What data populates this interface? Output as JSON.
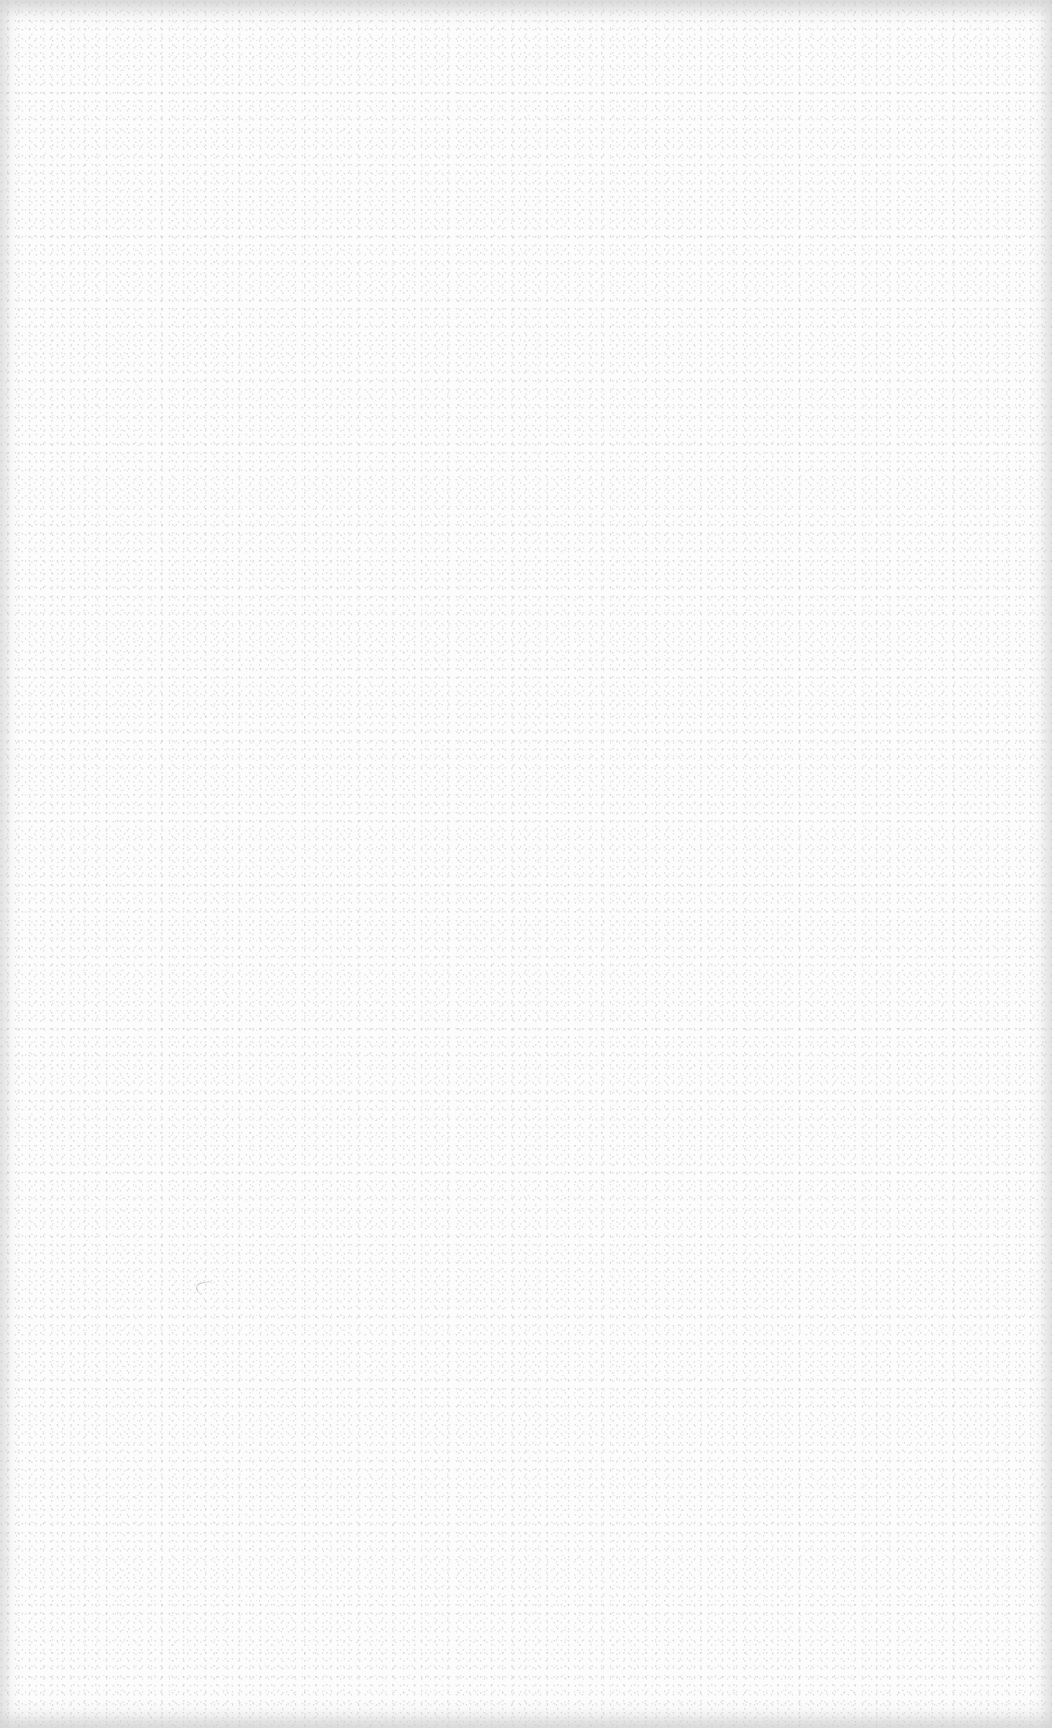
{
  "page": {
    "type": "blank-scanned-sheet",
    "text_content": [],
    "colors": {
      "paper": "#fcfcfc",
      "speckle": "#aaaaaa",
      "edge_shade": "#c8c8c8"
    }
  }
}
